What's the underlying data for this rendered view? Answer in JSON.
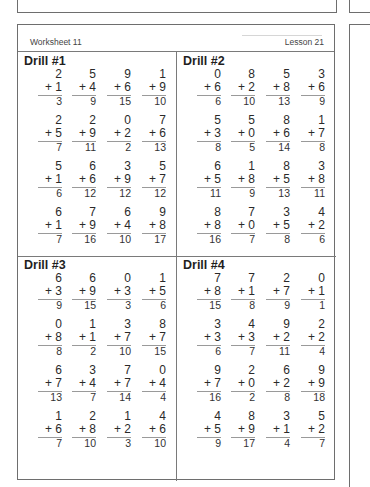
{
  "worksheet": {
    "title": "Worksheet 11",
    "lesson": "Lesson 21"
  },
  "drills": [
    {
      "title": "Drill #1",
      "rows": [
        [
          {
            "a": "2",
            "b": "+ 1",
            "s": "3"
          },
          {
            "a": "5",
            "b": "+ 4",
            "s": "9"
          },
          {
            "a": "9",
            "b": "+ 6",
            "s": "15"
          },
          {
            "a": "1",
            "b": "+ 9",
            "s": "10"
          }
        ],
        [
          {
            "a": "2",
            "b": "+ 5",
            "s": "7"
          },
          {
            "a": "2",
            "b": "+ 9",
            "s": "11"
          },
          {
            "a": "0",
            "b": "+ 2",
            "s": "2"
          },
          {
            "a": "7",
            "b": "+ 6",
            "s": "13"
          }
        ],
        [
          {
            "a": "5",
            "b": "+ 1",
            "s": "6"
          },
          {
            "a": "6",
            "b": "+ 6",
            "s": "12"
          },
          {
            "a": "3",
            "b": "+ 9",
            "s": "12"
          },
          {
            "a": "5",
            "b": "+ 7",
            "s": "12"
          }
        ],
        [
          {
            "a": "6",
            "b": "+ 1",
            "s": "7"
          },
          {
            "a": "7",
            "b": "+ 9",
            "s": "16"
          },
          {
            "a": "6",
            "b": "+ 4",
            "s": "10"
          },
          {
            "a": "9",
            "b": "+ 8",
            "s": "17"
          }
        ]
      ]
    },
    {
      "title": "Drill #2",
      "rows": [
        [
          {
            "a": "0",
            "b": "+ 6",
            "s": "6"
          },
          {
            "a": "8",
            "b": "+ 2",
            "s": "10"
          },
          {
            "a": "5",
            "b": "+ 8",
            "s": "13"
          },
          {
            "a": "3",
            "b": "+ 6",
            "s": "9"
          }
        ],
        [
          {
            "a": "5",
            "b": "+ 3",
            "s": "8"
          },
          {
            "a": "5",
            "b": "+ 0",
            "s": "5"
          },
          {
            "a": "8",
            "b": "+ 6",
            "s": "14"
          },
          {
            "a": "1",
            "b": "+ 7",
            "s": "8"
          }
        ],
        [
          {
            "a": "6",
            "b": "+ 5",
            "s": "11"
          },
          {
            "a": "1",
            "b": "+ 8",
            "s": "9"
          },
          {
            "a": "8",
            "b": "+ 5",
            "s": "13"
          },
          {
            "a": "3",
            "b": "+ 8",
            "s": "11"
          }
        ],
        [
          {
            "a": "8",
            "b": "+ 8",
            "s": "16"
          },
          {
            "a": "7",
            "b": "+ 0",
            "s": "7"
          },
          {
            "a": "3",
            "b": "+ 5",
            "s": "8"
          },
          {
            "a": "4",
            "b": "+ 2",
            "s": "6"
          }
        ]
      ]
    },
    {
      "title": "Drill #3",
      "rows": [
        [
          {
            "a": "6",
            "b": "+ 3",
            "s": "9"
          },
          {
            "a": "6",
            "b": "+ 9",
            "s": "15"
          },
          {
            "a": "0",
            "b": "+ 3",
            "s": "3"
          },
          {
            "a": "1",
            "b": "+ 5",
            "s": "6"
          }
        ],
        [
          {
            "a": "0",
            "b": "+ 8",
            "s": "8"
          },
          {
            "a": "1",
            "b": "+ 1",
            "s": "2"
          },
          {
            "a": "3",
            "b": "+ 7",
            "s": "10"
          },
          {
            "a": "8",
            "b": "+ 7",
            "s": "15"
          }
        ],
        [
          {
            "a": "6",
            "b": "+ 7",
            "s": "13"
          },
          {
            "a": "3",
            "b": "+ 4",
            "s": "7"
          },
          {
            "a": "7",
            "b": "+ 7",
            "s": "14"
          },
          {
            "a": "0",
            "b": "+ 4",
            "s": "4"
          }
        ],
        [
          {
            "a": "1",
            "b": "+ 6",
            "s": "7"
          },
          {
            "a": "2",
            "b": "+ 8",
            "s": "10"
          },
          {
            "a": "1",
            "b": "+ 2",
            "s": "3"
          },
          {
            "a": "4",
            "b": "+ 6",
            "s": "10"
          }
        ]
      ]
    },
    {
      "title": "Drill #4",
      "rows": [
        [
          {
            "a": "7",
            "b": "+ 8",
            "s": "15"
          },
          {
            "a": "7",
            "b": "+ 1",
            "s": "8"
          },
          {
            "a": "2",
            "b": "+ 7",
            "s": "9"
          },
          {
            "a": "0",
            "b": "+ 1",
            "s": "1"
          }
        ],
        [
          {
            "a": "3",
            "b": "+ 3",
            "s": "6"
          },
          {
            "a": "4",
            "b": "+ 3",
            "s": "7"
          },
          {
            "a": "9",
            "b": "+ 2",
            "s": "11"
          },
          {
            "a": "2",
            "b": "+ 2",
            "s": "4"
          }
        ],
        [
          {
            "a": "9",
            "b": "+ 7",
            "s": "16"
          },
          {
            "a": "2",
            "b": "+ 0",
            "s": "2"
          },
          {
            "a": "6",
            "b": "+ 2",
            "s": "8"
          },
          {
            "a": "9",
            "b": "+ 9",
            "s": "18"
          }
        ],
        [
          {
            "a": "4",
            "b": "+ 5",
            "s": "9"
          },
          {
            "a": "8",
            "b": "+ 9",
            "s": "17"
          },
          {
            "a": "3",
            "b": "+ 1",
            "s": "4"
          },
          {
            "a": "5",
            "b": "+ 2",
            "s": "7"
          }
        ]
      ]
    }
  ]
}
